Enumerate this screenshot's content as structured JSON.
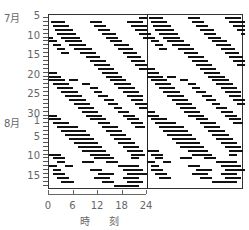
{
  "chart_data": {
    "type": "heatmap",
    "subtype": "double-plotted actogram",
    "title": "",
    "xlabel": "時 刻",
    "ylabel": "",
    "x_ticks": [
      0,
      6,
      12,
      18,
      24
    ],
    "x_range": [
      0,
      48
    ],
    "divider_hour": 24,
    "month_labels": [
      {
        "label": "7月",
        "row": 0
      },
      {
        "label": "8月",
        "row": 27
      }
    ],
    "y_tick_labels": [
      {
        "label": "5",
        "row": 0
      },
      {
        "label": "10",
        "row": 5
      },
      {
        "label": "15",
        "row": 10
      },
      {
        "label": "20",
        "row": 15
      },
      {
        "label": "25",
        "row": 20
      },
      {
        "label": "30",
        "row": 25
      },
      {
        "label": "1",
        "row": 27
      },
      {
        "label": "5",
        "row": 31
      },
      {
        "label": "10",
        "row": 36
      },
      {
        "label": "15",
        "row": 41
      }
    ],
    "days": 44,
    "date_range": [
      "7月5日",
      "8月17日"
    ],
    "activity_rows_hours": [
      [
        [
          22,
          24
        ]
      ],
      [
        [
          0.5,
          4
        ],
        [
          10,
          13
        ],
        [
          19,
          23
        ]
      ],
      [
        [
          1,
          5
        ],
        [
          11,
          14
        ],
        [
          20,
          24
        ]
      ],
      [
        [
          1.5,
          6
        ],
        [
          12,
          15
        ],
        [
          21,
          24
        ]
      ],
      [
        [
          2,
          6.5
        ],
        [
          13,
          16.5
        ],
        [
          22,
          24
        ]
      ],
      [
        [
          0,
          1
        ],
        [
          3,
          7.5
        ],
        [
          14,
          17
        ],
        [
          23,
          24
        ]
      ],
      [
        [
          0,
          2
        ],
        [
          4,
          8
        ],
        [
          15,
          18
        ]
      ],
      [
        [
          1,
          3
        ],
        [
          5,
          9
        ],
        [
          16,
          19.5
        ]
      ],
      [
        [
          2,
          4
        ],
        [
          6,
          10.5
        ],
        [
          17,
          20.5
        ]
      ],
      [
        [
          3,
          5
        ],
        [
          7.5,
          11.5
        ],
        [
          18,
          21.5
        ]
      ],
      [
        [
          9,
          12.5
        ],
        [
          19,
          22.5
        ]
      ],
      [
        [
          10,
          14
        ],
        [
          20,
          23.5
        ]
      ],
      [
        [
          11,
          15
        ],
        [
          21,
          24
        ]
      ],
      [
        [
          12,
          16
        ],
        [
          22,
          24
        ]
      ],
      [
        [
          13,
          17
        ],
        [
          0,
          2
        ]
      ],
      [
        [
          0,
          3
        ],
        [
          14,
          18
        ]
      ],
      [
        [
          0,
          4
        ],
        [
          5,
          7
        ],
        [
          15,
          19
        ]
      ],
      [
        [
          1,
          5
        ],
        [
          8,
          10
        ],
        [
          16,
          20
        ]
      ],
      [
        [
          2,
          6
        ],
        [
          10,
          12
        ],
        [
          17,
          21
        ]
      ],
      [
        [
          3,
          7
        ],
        [
          11,
          13
        ],
        [
          18,
          22
        ]
      ],
      [
        [
          4,
          8
        ],
        [
          12,
          14.5
        ],
        [
          19,
          23
        ]
      ],
      [
        [
          5,
          9
        ],
        [
          13.5,
          16
        ],
        [
          20,
          23
        ]
      ],
      [
        [
          6,
          10
        ],
        [
          14.5,
          17
        ],
        [
          21,
          24
        ]
      ],
      [
        [
          7,
          11
        ],
        [
          16,
          18
        ],
        [
          22,
          24
        ]
      ],
      [
        [
          8,
          12
        ],
        [
          17,
          19.5
        ]
      ],
      [
        [
          0,
          2
        ],
        [
          9,
          13
        ],
        [
          18,
          21
        ]
      ],
      [
        [
          0,
          3
        ],
        [
          10,
          14
        ],
        [
          19,
          22
        ]
      ],
      [
        [
          1,
          4
        ],
        [
          3,
          5
        ],
        [
          12,
          15
        ],
        [
          20,
          23
        ]
      ],
      [
        [
          2,
          5
        ],
        [
          4,
          7
        ],
        [
          13,
          17
        ],
        [
          21,
          23.5
        ]
      ],
      [
        [
          3,
          9
        ],
        [
          14,
          18
        ]
      ],
      [
        [
          4,
          10
        ],
        [
          15,
          19
        ]
      ],
      [
        [
          5,
          11
        ],
        [
          16,
          20
        ]
      ],
      [
        [
          6,
          12
        ],
        [
          17,
          21
        ]
      ],
      [
        [
          7,
          13
        ],
        [
          18,
          22
        ]
      ],
      [
        [
          8,
          14
        ],
        [
          19,
          23
        ]
      ],
      [
        [
          0,
          3
        ],
        [
          10,
          15
        ],
        [
          20,
          23.5
        ]
      ],
      [
        [
          1,
          4
        ],
        [
          11,
          16
        ],
        [
          20,
          22
        ]
      ],
      [
        [
          2,
          4
        ],
        [
          8,
          11
        ],
        [
          14,
          17
        ]
      ],
      [
        [
          0,
          2
        ],
        [
          4,
          6
        ],
        [
          17,
          22
        ]
      ],
      [
        [
          1,
          3
        ],
        [
          10,
          13
        ],
        [
          18,
          23
        ]
      ],
      [
        [
          1,
          4
        ],
        [
          12,
          16
        ],
        [
          19,
          24
        ]
      ],
      [
        [
          2,
          5
        ],
        [
          11,
          15
        ],
        [
          18,
          22
        ]
      ],
      [
        [
          3,
          6
        ],
        [
          13,
          16
        ],
        [
          19,
          23
        ]
      ],
      [
        [
          16,
          22
        ]
      ]
    ]
  },
  "axis": {
    "x_tick_labels": [
      "0",
      "6",
      "12",
      "18",
      "24"
    ],
    "x_title": "時 刻",
    "month_july": "7月",
    "month_august": "8月"
  },
  "colors": {
    "bar": "#111111",
    "frame": "#333333",
    "text": "#666666"
  }
}
